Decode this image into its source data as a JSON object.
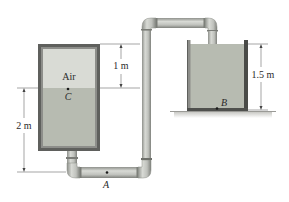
{
  "diagram": {
    "type": "fluid-siphon-system",
    "left_tank": {
      "air_label": "Air",
      "point_label": "C"
    },
    "right_tank": {
      "point_label": "B"
    },
    "pipe": {
      "point_label": "A"
    },
    "dimensions": {
      "air_height": "1 m",
      "left_water_height": "2 m",
      "right_water_height": "1.5 m"
    },
    "colors": {
      "water": "#b7bbb1",
      "air": "#d9dbd5",
      "tank_frame": "#6e6f6c",
      "pipe": "#c9cbc6",
      "pipe_shade": "#9c9e99",
      "ground": "#d6d6d3",
      "dimension_line": "#555555"
    }
  }
}
